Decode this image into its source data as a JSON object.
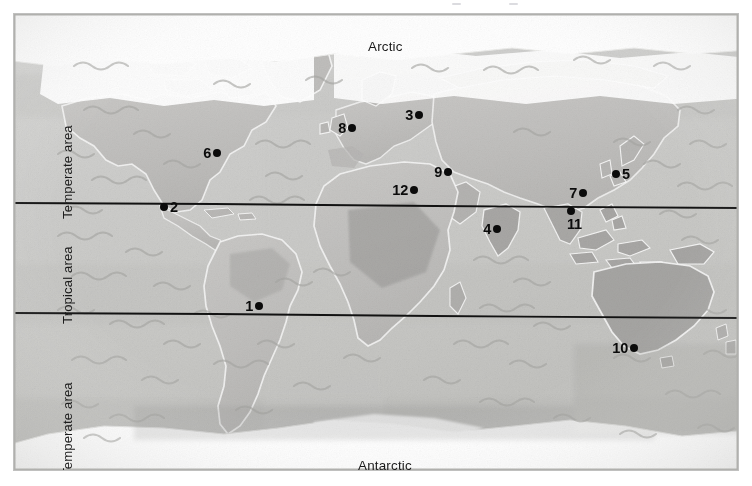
{
  "figure": {
    "type": "world-map",
    "projection": "equirectangular-style sketch",
    "style": "hand-painted grey wash / watercolour",
    "width": 752,
    "height": 486
  },
  "colors": {
    "ocean": "#cdcdcb",
    "land": "#c3c2c0",
    "land_dark": "#a9a8a6",
    "ice": "#ffffff",
    "marker": "#0b0b0b",
    "tropic_line": "#111111",
    "label_text": "#1b1b1b",
    "border": "#b4b4b2"
  },
  "polar_labels": {
    "north": "Arctic",
    "south": "Antarctic"
  },
  "zone_labels": {
    "temperate_north": "Temperate area",
    "tropical": "Tropical area",
    "temperate_south": "Temperate area"
  },
  "boundary_lines": [
    {
      "name": "tropic-of-cancer",
      "y_left": 203,
      "y_right": 208
    },
    {
      "name": "tropic-of-capricorn",
      "y_left": 313,
      "y_right": 318
    }
  ],
  "markers": [
    {
      "id": 1,
      "label": "1",
      "x": 259,
      "y": 306,
      "label_side": "left",
      "region": "South America"
    },
    {
      "id": 2,
      "label": "2",
      "x": 164,
      "y": 207,
      "label_side": "right",
      "region": "Central America"
    },
    {
      "id": 3,
      "label": "3",
      "x": 419,
      "y": 115,
      "label_side": "left",
      "region": "Eastern Europe"
    },
    {
      "id": 4,
      "label": "4",
      "x": 497,
      "y": 229,
      "label_side": "left",
      "region": "India"
    },
    {
      "id": 5,
      "label": "5",
      "x": 616,
      "y": 174,
      "label_side": "right",
      "region": "Japan"
    },
    {
      "id": 6,
      "label": "6",
      "x": 217,
      "y": 153,
      "label_side": "left",
      "region": "North America"
    },
    {
      "id": 7,
      "label": "7",
      "x": 583,
      "y": 193,
      "label_side": "left",
      "region": "Southern China"
    },
    {
      "id": 8,
      "label": "8",
      "x": 352,
      "y": 128,
      "label_side": "left",
      "region": "Western Europe"
    },
    {
      "id": 9,
      "label": "9",
      "x": 448,
      "y": 172,
      "label_side": "left",
      "region": "Middle East"
    },
    {
      "id": 10,
      "label": "10",
      "x": 634,
      "y": 348,
      "label_side": "left",
      "region": "Australia"
    },
    {
      "id": 11,
      "label": "11",
      "x": 571,
      "y": 211,
      "label_side": "below",
      "region": "Indochina"
    },
    {
      "id": 12,
      "label": "12",
      "x": 414,
      "y": 190,
      "label_side": "left",
      "region": "North Africa"
    }
  ]
}
